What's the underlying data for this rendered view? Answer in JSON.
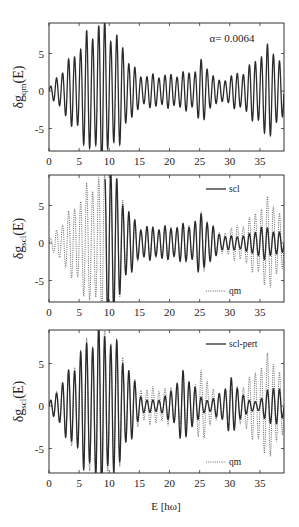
{
  "chart_data": [
    {
      "type": "line",
      "panel": 1,
      "title": "",
      "annotation": "α= 0.0064",
      "xlabel": "",
      "ylabel": "δg_qm(E)",
      "ylabel_main": "δg",
      "ylabel_sub": "qm",
      "ylabel_tail": "(E)",
      "xlim": [
        0,
        39
      ],
      "ylim": [
        -8,
        9
      ],
      "xticks": [
        0,
        5,
        10,
        15,
        20,
        25,
        30,
        35
      ],
      "yticks": [
        -5,
        0,
        5
      ],
      "grid": false,
      "legend": [],
      "series": [
        {
          "name": "qm",
          "style": "solid",
          "description": "oscillating signal, period ~1 unit, amplitude envelope",
          "envelope": {
            "x": [
              0,
              2,
              4,
              6,
              8,
              9,
              10,
              12,
              14,
              15,
              20,
              24,
              25,
              26,
              28,
              30,
              33,
              35,
              37,
              38,
              39
            ],
            "amp": [
              0.3,
              2.5,
              4.5,
              6.8,
              8.5,
              8.7,
              8.0,
              6.0,
              3.0,
              2.0,
              2.0,
              2.5,
              3.7,
              3.5,
              1.2,
              1.8,
              2.8,
              4.8,
              5.8,
              4.5,
              2.5
            ]
          },
          "period": 1.0
        }
      ]
    },
    {
      "type": "line",
      "panel": 2,
      "title": "",
      "xlabel": "",
      "ylabel": "δg_scl(E)",
      "ylabel_main": "δg",
      "ylabel_sub": "scl",
      "ylabel_tail": "(E)",
      "xlim": [
        0,
        39
      ],
      "ylim": [
        -8,
        9
      ],
      "xticks": [
        0,
        5,
        10,
        15,
        20,
        25,
        30,
        35
      ],
      "yticks": [
        -5,
        0,
        5
      ],
      "grid": false,
      "legend": [
        {
          "label": "scl",
          "style": "solid",
          "position": "upper right"
        },
        {
          "label": "qm",
          "style": "dotted",
          "position": "lower right"
        }
      ],
      "series": [
        {
          "name": "scl",
          "style": "solid",
          "description": "semiclassical; diverges near E≈9.5-10, matches qm for E>10",
          "envelope": {
            "x": [
              9.3,
              9.5,
              10,
              10.5,
              12,
              14,
              15,
              20,
              24,
              25,
              26,
              28,
              30,
              33,
              35,
              37,
              39
            ],
            "amp": [
              9.5,
              12,
              12,
              9.0,
              6.0,
              3.0,
              2.0,
              2.0,
              2.5,
              3.6,
              3.4,
              1.2,
              0.8,
              1.0,
              2.0,
              1.8,
              1.0
            ]
          },
          "period": 1.0
        },
        {
          "name": "qm",
          "style": "dotted",
          "envelope": {
            "x": [
              0,
              2,
              4,
              6,
              8,
              9,
              10,
              12,
              14,
              15,
              20,
              24,
              25,
              26,
              28,
              30,
              33,
              35,
              37,
              38,
              39
            ],
            "amp": [
              0.3,
              2.5,
              4.5,
              6.8,
              8.5,
              8.7,
              8.0,
              6.0,
              3.0,
              2.0,
              2.0,
              2.5,
              3.7,
              3.5,
              1.2,
              1.8,
              2.8,
              4.8,
              5.8,
              4.5,
              2.5
            ]
          },
          "period": 1.0
        }
      ]
    },
    {
      "type": "line",
      "panel": 3,
      "title": "",
      "xlabel": "E [hω]",
      "ylabel": "δg_scl(E)",
      "ylabel_main": "δg",
      "ylabel_sub": "scl",
      "ylabel_tail": "(E)",
      "xlim": [
        0,
        39
      ],
      "ylim": [
        -8,
        9
      ],
      "xticks": [
        0,
        5,
        10,
        15,
        20,
        25,
        30,
        35
      ],
      "yticks": [
        -5,
        0,
        5
      ],
      "grid": false,
      "legend": [
        {
          "label": "scl-pert",
          "style": "solid",
          "position": "upper right"
        },
        {
          "label": "qm",
          "style": "dotted",
          "position": "lower right"
        }
      ],
      "series": [
        {
          "name": "scl-pert",
          "style": "solid",
          "description": "perturbative semiclassical; matches qm up to E≈15, then beats",
          "envelope": {
            "x": [
              0,
              2,
              4,
              6,
              8,
              9,
              10,
              12,
              14,
              15,
              16,
              19,
              21,
              22,
              23,
              24,
              25,
              27,
              29,
              30,
              31,
              33,
              35,
              36,
              37,
              38,
              39
            ],
            "amp": [
              0.3,
              2.5,
              4.5,
              6.8,
              8.5,
              8.7,
              8.0,
              6.0,
              3.0,
              1.5,
              0.6,
              0.8,
              2.5,
              3.7,
              3.5,
              2.5,
              1.0,
              0.6,
              2.0,
              3.0,
              2.5,
              0.6,
              0.6,
              1.5,
              2.5,
              2.0,
              1.0
            ]
          },
          "period": 1.0
        },
        {
          "name": "qm",
          "style": "dotted",
          "envelope": {
            "x": [
              0,
              2,
              4,
              6,
              8,
              9,
              10,
              12,
              14,
              15,
              20,
              24,
              25,
              26,
              28,
              30,
              33,
              35,
              37,
              38,
              39
            ],
            "amp": [
              0.3,
              2.5,
              4.5,
              6.8,
              8.5,
              8.7,
              8.0,
              6.0,
              3.0,
              2.0,
              2.0,
              2.5,
              3.7,
              3.5,
              1.2,
              1.8,
              2.8,
              4.8,
              5.8,
              4.5,
              2.5
            ]
          },
          "period": 1.0
        }
      ]
    }
  ],
  "layout": {
    "panels": [
      {
        "left": 49,
        "right": 284,
        "top": 23,
        "bottom": 151,
        "y0": 91,
        "ppu_y": 7.5
      },
      {
        "left": 49,
        "right": 284,
        "top": 175,
        "bottom": 302,
        "y0": 243,
        "ppu_y": 7.5
      },
      {
        "left": 49,
        "right": 284,
        "top": 330,
        "bottom": 473,
        "y0": 406,
        "ppu_y": 8.5
      }
    ]
  }
}
